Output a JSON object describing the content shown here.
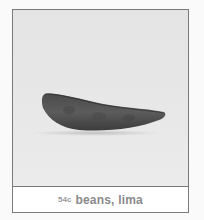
{
  "card": {
    "image": {
      "subject": "lima-bean-pod",
      "background_color": "#e6e6e6"
    },
    "caption": {
      "price": "54c",
      "label": "beans, lima"
    }
  },
  "colors": {
    "border": "#7a7a7a",
    "caption_text": "#8a8a8a",
    "bean_dark": "#3a3a3a",
    "bean_mid": "#5a5a5a"
  }
}
